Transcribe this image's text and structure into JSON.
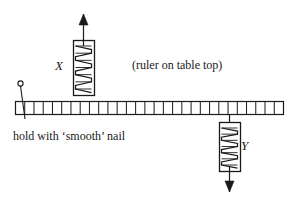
{
  "diagram": {
    "background_color": "#ffffff",
    "stroke_color": "#1a1a1a",
    "labels": {
      "spring_x": "X",
      "spring_y": "Y",
      "ruler_note": "(ruler on table top)",
      "nail_note": "hold with ‘smooth’ nail"
    },
    "ruler": {
      "name": "ruler",
      "x": 15,
      "y": 101,
      "width": 268,
      "height": 13,
      "cell_count": 29
    },
    "nail": {
      "name": "smooth-nail",
      "head_cx": 20.5,
      "head_cy": 83.5,
      "head_r": 2.6,
      "shaft_top_x": 20.5,
      "shaft_top_y": 86,
      "shaft_bottom_x": 25,
      "shaft_bottom_y": 119
    },
    "springs": [
      {
        "name": "spring-balance-x",
        "label": "X",
        "box_x": 73,
        "box_y": 40,
        "box_width": 21,
        "box_height": 55,
        "coil_turns": 6,
        "shaft_x": 83.5,
        "arrow_direction": "up",
        "arrow_tip_y": 14,
        "arrow_tail_y": 95,
        "arrow_head_length": 11,
        "arrow_head_halfwidth": 4.5
      },
      {
        "name": "spring-balance-y",
        "label": "Y",
        "box_x": 219,
        "box_y": 122,
        "box_width": 21,
        "box_height": 49,
        "coil_turns": 6,
        "shaft_x": 229.5,
        "arrow_direction": "down",
        "arrow_tip_y": 192,
        "arrow_tail_y": 114,
        "arrow_head_length": 11,
        "arrow_head_halfwidth": 4.5
      }
    ]
  }
}
